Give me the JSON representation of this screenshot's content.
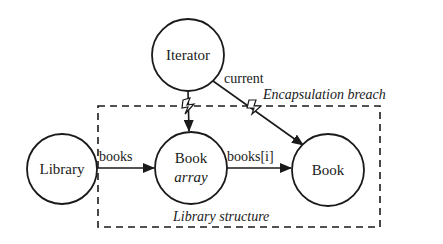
{
  "diagram": {
    "nodes": [
      {
        "id": "iterator",
        "label": "Iterator",
        "sublabel": ""
      },
      {
        "id": "library",
        "label": "Library",
        "sublabel": ""
      },
      {
        "id": "book-array",
        "label": "Book",
        "sublabel": "array"
      },
      {
        "id": "book",
        "label": "Book",
        "sublabel": ""
      }
    ],
    "edges": [
      {
        "from": "library",
        "to": "book-array",
        "label": "books"
      },
      {
        "from": "book-array",
        "to": "book",
        "label": "books[i]"
      },
      {
        "from": "iterator",
        "to": "book",
        "label": "current",
        "breach": true
      },
      {
        "from": "iterator",
        "to": "book-array",
        "label": "",
        "breach": true
      }
    ],
    "annotations": {
      "breach": "Encapsulation breach",
      "group": "Library structure"
    },
    "colors": {
      "stroke": "#1a1a1a",
      "background": "#ffffff"
    }
  }
}
